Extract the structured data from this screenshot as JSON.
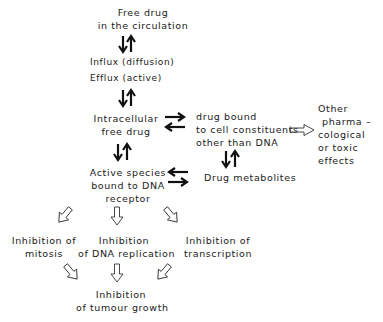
{
  "nodes": {
    "free_drug": {
      "lines": [
        "Free drug",
        "in the circulation"
      ]
    },
    "transport": {
      "lines": [
        "Influx (diffusion)",
        "Efflux (active)"
      ]
    },
    "intracellular": {
      "lines": [
        "Intracellular",
        "free drug"
      ]
    },
    "bound_constituents": {
      "lines": [
        "drug bound",
        "to cell constituents",
        "other than DNA"
      ]
    },
    "other_effects": {
      "lines": [
        "Other",
        "pharma –",
        "cological",
        "or toxic",
        "effects"
      ]
    },
    "active_species": {
      "lines": [
        "Active species",
        "bound to DNA",
        "receptor"
      ]
    },
    "metabolites": {
      "lines": [
        "Drug metabolites"
      ]
    },
    "inh_mitosis": {
      "lines": [
        "Inhibition of",
        "mitosis"
      ]
    },
    "inh_dna": {
      "lines": [
        "Inhibition",
        "of DNA replication"
      ]
    },
    "inh_transcription": {
      "lines": [
        "Inhibition of",
        "transcription"
      ]
    },
    "inh_tumour": {
      "lines": [
        "Inhibition",
        "of tumour growth"
      ]
    }
  },
  "edges": [
    {
      "from": "free_drug",
      "to": "transport",
      "type": "reversible-vertical"
    },
    {
      "from": "transport",
      "to": "intracellular",
      "type": "reversible-vertical"
    },
    {
      "from": "intracellular",
      "to": "bound_constituents",
      "type": "reversible-horizontal"
    },
    {
      "from": "intracellular",
      "to": "active_species",
      "type": "reversible-vertical"
    },
    {
      "from": "bound_constituents",
      "to": "metabolites",
      "type": "reversible-vertical"
    },
    {
      "from": "active_species",
      "to": "metabolites",
      "type": "reversible-horizontal"
    },
    {
      "from": "bound_constituents",
      "to": "other_effects",
      "type": "hollow-arrow"
    },
    {
      "from": "active_species",
      "to": "inh_mitosis",
      "type": "hollow-arrow"
    },
    {
      "from": "active_species",
      "to": "inh_dna",
      "type": "hollow-arrow"
    },
    {
      "from": "active_species",
      "to": "inh_transcription",
      "type": "hollow-arrow"
    },
    {
      "from": "inh_mitosis",
      "to": "inh_tumour",
      "type": "hollow-arrow"
    },
    {
      "from": "inh_dna",
      "to": "inh_tumour",
      "type": "hollow-arrow"
    },
    {
      "from": "inh_transcription",
      "to": "inh_tumour",
      "type": "hollow-arrow"
    }
  ]
}
